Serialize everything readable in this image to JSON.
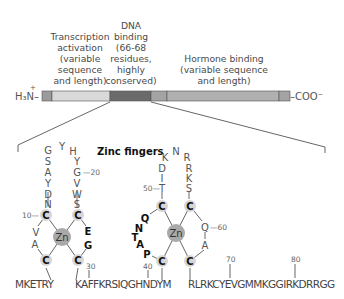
{
  "domain_labels": {
    "transcription": [
      "Transcription",
      "activation",
      "(variable",
      "sequence",
      "and length)"
    ],
    "dna": [
      "DNA",
      "binding",
      "(66-68",
      "residues,",
      "highly",
      "conserved)"
    ],
    "hormone": [
      "Hormone binding",
      "(variable sequence",
      "and length)"
    ]
  },
  "termini": {
    "n_terminus": "H₃N–",
    "n_charge": "+",
    "c_terminus": "–COO⁻"
  },
  "bar": {
    "segments": [
      {
        "name": "n-cap",
        "x": 42,
        "w": 10,
        "color": "#9b9b9b"
      },
      {
        "name": "transcription-activation",
        "x": 52,
        "w": 58,
        "color": "#d9d9d9"
      },
      {
        "name": "dna-binding",
        "x": 110,
        "w": 41,
        "color": "#6b6b6b"
      },
      {
        "name": "hinge",
        "x": 151,
        "w": 16,
        "color": "#a3a3a3"
      },
      {
        "name": "hormone-binding",
        "x": 167,
        "w": 112,
        "color": "#b0b0b0"
      },
      {
        "name": "c-cap",
        "x": 279,
        "w": 11,
        "color": "#a3a3a3"
      }
    ]
  },
  "zinc_title": "Zinc fingers",
  "zinc": "Zn",
  "finger1": {
    "loop_left": [
      "S",
      "A",
      "Y",
      "D",
      "N"
    ],
    "loop_top": [
      "G",
      "Y",
      "H"
    ],
    "loop_right": [
      "Y",
      "G",
      "V",
      "W",
      "S"
    ],
    "left_link": [
      "V",
      "A"
    ],
    "right_link": [
      "E",
      "G"
    ],
    "cys": "C",
    "num_10": "10—",
    "num_20": "—20",
    "num_30": "30"
  },
  "finger2": {
    "loop_top": [
      "K",
      "N",
      "R"
    ],
    "loop_left": [
      "D",
      "I",
      "T"
    ],
    "loop_right": [
      "R",
      "K",
      "S"
    ],
    "left_link": [
      "Q",
      "N",
      "T",
      "A",
      "P"
    ],
    "right_link": [
      "Q",
      "A"
    ],
    "cys": "C",
    "num_40": "40",
    "num_50": "50—",
    "num_60": "—60"
  },
  "sequence": {
    "part1": "MKETRY",
    "part2": "KAFFKRSIQGHNDYM",
    "part3": "RLRKCYEVGMMKGGIRKDRRGG",
    "num_70": "70",
    "num_80": "80"
  }
}
